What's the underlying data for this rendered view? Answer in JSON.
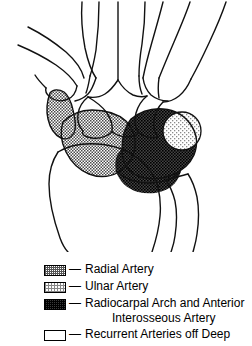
{
  "figure": {
    "regions": [
      {
        "name": "radial-artery-territory",
        "pattern": "radial",
        "location": "radial (left) side of carpus, trapezium/scaphoid region"
      },
      {
        "name": "ulnar-artery-territory",
        "pattern": "ulnar",
        "location": "ulnar (right) side, pisiform region"
      },
      {
        "name": "radiocarpal-arch-territory",
        "pattern": "arch",
        "location": "distal radius and ulnar carpus"
      },
      {
        "name": "recurrent-arteries-territory",
        "pattern": "recurrent",
        "location": "unshaded carpal bones"
      }
    ]
  },
  "legend": {
    "dash": "—",
    "entries": [
      {
        "pattern_name": "radial-artery-swatch",
        "label": "Radial Artery",
        "label2": "",
        "color": "#555555"
      },
      {
        "pattern_name": "ulnar-artery-swatch",
        "label": "Ulnar Artery",
        "label2": "",
        "color": "#888888"
      },
      {
        "pattern_name": "radiocarpal-arch-swatch",
        "label": "Radiocarpal Arch and Anterior",
        "label2": "Interosseous Artery",
        "color": "#3a3a3a"
      },
      {
        "pattern_name": "recurrent-arteries-swatch",
        "label": "Recurrent Arteries off Deep",
        "label2": "",
        "color": "#ffffff"
      }
    ]
  },
  "colors": {
    "outline": "#000000",
    "background": "#ffffff",
    "radial_fill": "#555555",
    "ulnar_fill": "#888888",
    "arch_fill": "#3a3a3a"
  }
}
